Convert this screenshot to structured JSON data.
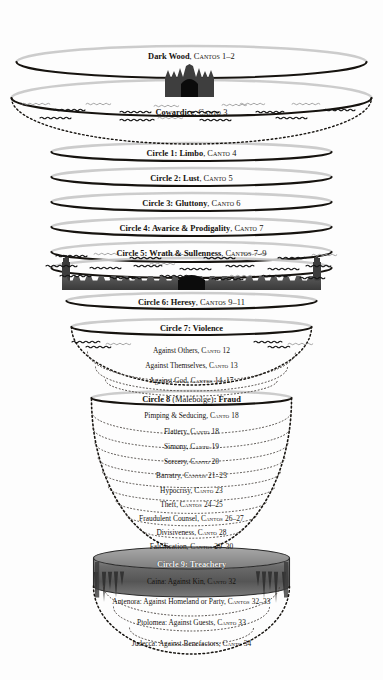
{
  "diagram": {
    "background_color": "#fdfdfd",
    "ink_color": "#16130f",
    "ring_shadow_color": "#c9c9c9",
    "stone_color": "#4a4a4a",
    "ice_color": "#6e6e6e"
  },
  "levels": [
    {
      "id": "dark-wood",
      "name": "Dark Wood",
      "cantos": "Cantos 1–2",
      "y": 53,
      "kind": "ring"
    },
    {
      "id": "cowardice",
      "name": "Cowardice",
      "cantos": "Canto 3",
      "y": 109,
      "kind": "vestibule"
    },
    {
      "id": "circle-1",
      "name": "Circle 1: Limbo",
      "cantos": "Canto 4",
      "y": 150,
      "kind": "ring"
    },
    {
      "id": "circle-2",
      "name": "Circle 2: Lust",
      "cantos": "Canto 5",
      "y": 175,
      "kind": "ring"
    },
    {
      "id": "circle-3",
      "name": "Circle 3: Gluttony",
      "cantos": "Canto 6",
      "y": 200,
      "kind": "ring"
    },
    {
      "id": "circle-4",
      "name": "Circle 4: Avarice & Prodigality",
      "cantos": "Canto 7",
      "y": 225,
      "kind": "ring"
    },
    {
      "id": "circle-5",
      "name": "Circle 5: Wrath & Sullenness",
      "cantos": "Cantos 7–9",
      "y": 250,
      "kind": "ring-marsh"
    },
    {
      "id": "circle-6",
      "name": "Circle 6: Heresy",
      "cantos": "Cantos 9–11",
      "y": 299,
      "kind": "ring-dis"
    },
    {
      "id": "circle-7",
      "name": "Circle 7: Violence",
      "cantos": "",
      "y": 325,
      "kind": "bowl"
    },
    {
      "id": "circle-8",
      "name": "Circle 8",
      "name_paren": "(Malebolge)",
      "name_tail": ": Fraud",
      "cantos": "",
      "y": 396,
      "kind": "bowl"
    },
    {
      "id": "circle-9",
      "name": "Circle 9: Treachery",
      "cantos": "",
      "y": 561,
      "kind": "ice"
    }
  ],
  "circle7_sublevels": [
    {
      "label": "Against Others",
      "cantos": "Canto 12",
      "y": 347
    },
    {
      "label": "Against Themselves",
      "cantos": "Canto 13",
      "y": 362
    },
    {
      "label": "Against God",
      "cantos": "Cantos 14–17",
      "y": 377
    }
  ],
  "circle8_sublevels": [
    {
      "label": "Pimping & Seducing",
      "cantos": "Canto 18",
      "y": 412
    },
    {
      "label": "Flattery",
      "cantos": "Canto 18",
      "y": 428
    },
    {
      "label": "Simony",
      "cantos": "Canto 19",
      "y": 443
    },
    {
      "label": "Sorcery",
      "cantos": "Canto 20",
      "y": 458
    },
    {
      "label": "Barratry",
      "cantos": "Cantos 21–23",
      "y": 472
    },
    {
      "label": "Hypocrisy",
      "cantos": "Canto 23",
      "y": 487
    },
    {
      "label": "Theft",
      "cantos": "Cantos 24–25",
      "y": 501
    },
    {
      "label": "Fraudulent Counsel",
      "cantos": "Cantos 26–27",
      "y": 515
    },
    {
      "label": "Divisiveness",
      "cantos": "Canto 28",
      "y": 529
    },
    {
      "label": "Falsification",
      "cantos": "Cantos 29–30",
      "y": 543
    }
  ],
  "circle9_sublevels": [
    {
      "label": "Caina: Against Kin",
      "cantos": "Canto 32",
      "y": 578
    },
    {
      "label": "Antenora: Against Homeland or Party",
      "cantos": "Cantos 32–33",
      "y": 598
    },
    {
      "label": "Ptolomea: Against Guests",
      "cantos": "Canto 33",
      "y": 619
    },
    {
      "label": "Judecca: Against Benefactors",
      "cantos": "Canto 34",
      "y": 640
    }
  ],
  "icons": {
    "gate": "hell-gate-icon",
    "dis_walls": "city-of-dis-walls-icon",
    "ice": "frozen-lake-cocytus-icon",
    "waves": "wind-storm-squiggles-icon"
  }
}
